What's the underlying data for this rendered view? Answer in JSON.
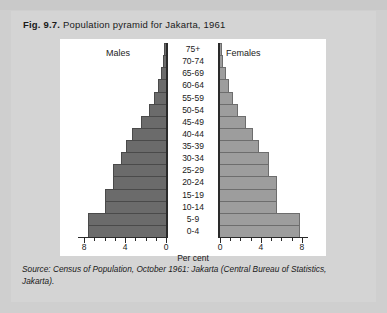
{
  "figure": {
    "number": "Fig. 9.7.",
    "title": "Population pyramid for Jakarta, 1961",
    "source": "Source: Census of Population, October 1961: Jakarta (Central Bureau of Statistics,",
    "source_line2": "Jakarta)."
  },
  "colors": {
    "page_background": "#cfcfcf",
    "figure_background": "#d4d4d4",
    "plot_background": "#ffffff",
    "males_bar": "#6b6b6b",
    "females_bar": "#9d9d9d",
    "axis": "#2a2a2a",
    "text": "#1a1a1a"
  },
  "chart_data": {
    "type": "bar",
    "title": "Population pyramid for Jakarta, 1961",
    "subtitle": "",
    "xlabel": "Per cent",
    "ylabel": "",
    "orientation": "horizontal-diverging",
    "grid": false,
    "legend_position": "inside-top",
    "categories": [
      "75+",
      "70-74",
      "65-69",
      "60-64",
      "55-59",
      "50-54",
      "45-49",
      "40-44",
      "35-39",
      "30-34",
      "25-29",
      "20-24",
      "15-19",
      "10-14",
      "5-9",
      "0-4"
    ],
    "series": [
      {
        "name": "Males",
        "direction": "left",
        "values": [
          0.2,
          0.3,
          0.5,
          0.8,
          1.2,
          1.7,
          2.4,
          3.3,
          3.9,
          4.4,
          5.2,
          5.2,
          6.0,
          6.0,
          7.6,
          7.6
        ]
      },
      {
        "name": "Females",
        "direction": "right",
        "values": [
          0.2,
          0.3,
          0.6,
          0.9,
          1.3,
          1.8,
          2.5,
          3.2,
          3.8,
          4.8,
          4.8,
          5.6,
          5.6,
          5.6,
          7.8,
          7.8
        ]
      }
    ],
    "xlim_left": [
      8,
      0
    ],
    "xlim_right": [
      0,
      8
    ],
    "xticks_left": [
      "8",
      "4",
      "0"
    ],
    "xticks_right": [
      "0",
      "4",
      "8"
    ],
    "xtick_interval": 1,
    "xtick_major_interval": 4
  },
  "axis_labels": {
    "left": [
      "8",
      "4",
      "0"
    ],
    "right": [
      "0",
      "4",
      "8"
    ],
    "per_cent": "Per cent"
  },
  "legend": {
    "males": "Males",
    "females": "Females"
  }
}
